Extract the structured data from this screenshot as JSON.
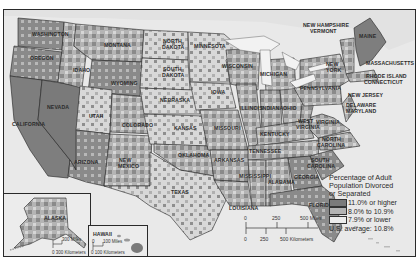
{
  "map": {
    "title": "Percentage of Adult Population Divorced or Separated",
    "legend": {
      "title_lines": [
        "Percentage of Adult",
        "Population Divorced",
        "or Separated"
      ],
      "items": [
        {
          "label": "11.0% or higher",
          "color": "#7a7a7a"
        },
        {
          "label": "8.0% to 10.9%",
          "color": "#b4b4b4"
        },
        {
          "label": "7.9% or lower",
          "color": "#ececec"
        }
      ],
      "average": "U.S. average: 10.8%"
    },
    "scale": {
      "miles": [
        "0",
        "250",
        "500 Miles"
      ],
      "kilometers": [
        "0",
        "250",
        "500 Kilometers"
      ]
    },
    "insets": {
      "alaska": {
        "label": "ALASKA",
        "miles": "300 Miles",
        "km": "0 300 Kilometers"
      },
      "hawaii": {
        "label": "HAWAII",
        "miles": "100 Miles",
        "miles_zero": "0",
        "km": "0  100 Kilometers"
      }
    },
    "states": {
      "washington": "WASHINGTON",
      "oregon": "OREGON",
      "california": "CALIFORNIA",
      "nevada": "NEVADA",
      "idaho": "IDAHO",
      "montana": "MONTANA",
      "wyoming": "WYOMING",
      "utah": "UTAH",
      "arizona": "ARIZONA",
      "colorado": "COLORADO",
      "new_mexico_1": "NEW",
      "new_mexico_2": "MEXICO",
      "north_dakota_1": "NORTH",
      "north_dakota_2": "DAKOTA",
      "south_dakota_1": "SOUTH",
      "south_dakota_2": "DAKOTA",
      "nebraska": "NEBRASKA",
      "kansas": "KANSAS",
      "oklahoma": "OKLAHOMA",
      "texas": "TEXAS",
      "minnesota": "MINNESOTA",
      "iowa": "IOWA",
      "missouri": "MISSOURI",
      "arkansas": "ARKANSAS",
      "louisiana": "LOUISIANA",
      "wisconsin": "WISCONSIN",
      "illinois": "ILLINOIS",
      "michigan": "MICHIGAN",
      "indiana": "INDIANA",
      "ohio": "OHIO",
      "kentucky": "KENTUCKY",
      "tennessee": "TENNESSEE",
      "mississippi": "MISSISSIPPI",
      "alabama": "ALABAMA",
      "georgia": "GEORGIA",
      "florida": "FLORIDA",
      "south_carolina_1": "SOUTH",
      "south_carolina_2": "CAROLINA",
      "north_carolina_1": "NORTH",
      "north_carolina_2": "CAROLINA",
      "virginia": "VIRGINIA",
      "west_virginia_1": "WEST",
      "west_virginia_2": "VIRGINIA",
      "pennsylvania": "PENNSYLVANIA",
      "new_york_1": "NEW",
      "new_york_2": "YORK",
      "new_jersey": "NEW JERSEY",
      "delaware": "DELAWARE",
      "maryland": "MARYLAND",
      "massachusetts": "MASSACHUSETTS",
      "rhode_island": "RHODE ISLAND",
      "connecticut": "CONNECTICUT",
      "new_hampshire": "NEW HAMPSHIRE",
      "vermont": "VERMONT",
      "maine": "MAINE"
    },
    "colors": {
      "high": "#7a7a7a",
      "mid": "#b4b4b4",
      "low": "#ececec",
      "water": "#e6e6e6",
      "border": "#222222"
    }
  }
}
